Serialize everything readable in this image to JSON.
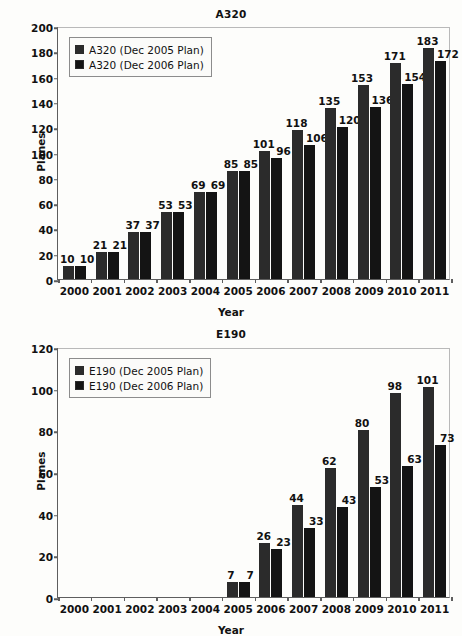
{
  "chart_data": [
    {
      "type": "bar",
      "title": "A320",
      "xlabel": "Year",
      "ylabel": "Planes",
      "ylim": [
        0,
        200
      ],
      "ytick_step": 20,
      "yticks": [
        0,
        20,
        40,
        60,
        80,
        100,
        120,
        140,
        160,
        180,
        200
      ],
      "grid": false,
      "legend_position": "top-left",
      "categories": [
        "2000",
        "2001",
        "2002",
        "2003",
        "2004",
        "2005",
        "2006",
        "2007",
        "2008",
        "2009",
        "2010",
        "2011"
      ],
      "series": [
        {
          "name": "A320 (Dec 2005 Plan)",
          "color": "#2b2b2b",
          "values": [
            10,
            21,
            37,
            53,
            69,
            85,
            101,
            118,
            135,
            153,
            171,
            183
          ],
          "labels": [
            "10",
            "21",
            "37",
            "53",
            "69",
            "85",
            "101",
            "118",
            "135",
            "153",
            "171",
            "183"
          ]
        },
        {
          "name": "A320 (Dec 2006 Plan)",
          "color": "#141414",
          "values": [
            10,
            21,
            37,
            53,
            69,
            85,
            96,
            106,
            120,
            136,
            154,
            172
          ],
          "labels": [
            "10",
            "21",
            "37",
            "53",
            "69",
            "85",
            "96",
            "106",
            "120",
            "136",
            "154",
            "172"
          ]
        }
      ]
    },
    {
      "type": "bar",
      "title": "E190",
      "xlabel": "Year",
      "ylabel": "Planes",
      "ylim": [
        0,
        120
      ],
      "ytick_step": 20,
      "yticks": [
        0,
        20,
        40,
        60,
        80,
        100,
        120
      ],
      "grid": false,
      "legend_position": "top-left",
      "categories": [
        "2000",
        "2001",
        "2002",
        "2003",
        "2004",
        "2005",
        "2006",
        "2007",
        "2008",
        "2009",
        "2010",
        "2011"
      ],
      "series": [
        {
          "name": "E190 (Dec 2005 Plan)",
          "color": "#2b2b2b",
          "values": [
            0,
            0,
            0,
            0,
            0,
            7,
            26,
            44,
            62,
            80,
            98,
            101
          ],
          "labels": [
            "",
            "",
            "",
            "",
            "",
            "7",
            "26",
            "44",
            "62",
            "80",
            "98",
            "101"
          ]
        },
        {
          "name": "E190 (Dec 2006 Plan)",
          "color": "#141414",
          "values": [
            0,
            0,
            0,
            0,
            0,
            7,
            23,
            33,
            43,
            53,
            63,
            73
          ],
          "labels": [
            "",
            "",
            "",
            "",
            "",
            "7",
            "23",
            "33",
            "43",
            "53",
            "63",
            "73"
          ]
        }
      ]
    }
  ]
}
